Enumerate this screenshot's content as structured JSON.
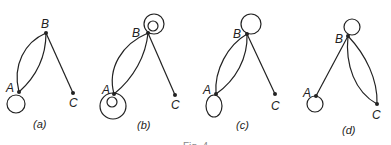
{
  "figure": {
    "caption_partial": "Fig. 4",
    "panels": [
      {
        "id": "a",
        "caption": "(a)",
        "nodes": [
          {
            "label": "A",
            "x": 19,
            "y": 92
          },
          {
            "label": "B",
            "x": 46,
            "y": 33
          },
          {
            "label": "C",
            "x": 73,
            "y": 93
          }
        ],
        "edges": [
          {
            "from": "A",
            "to": "B",
            "count": 2
          },
          {
            "from": "B",
            "to": "C",
            "count": 1
          }
        ],
        "loops": [
          {
            "node": "A",
            "count": 1
          }
        ]
      },
      {
        "id": "b",
        "caption": "(b)",
        "nodes": [
          {
            "label": "A",
            "x": 114,
            "y": 94
          },
          {
            "label": "B",
            "x": 148,
            "y": 33
          },
          {
            "label": "C",
            "x": 175,
            "y": 95
          }
        ],
        "edges": [
          {
            "from": "A",
            "to": "B",
            "count": 2
          },
          {
            "from": "B",
            "to": "C",
            "count": 1
          }
        ],
        "loops": [
          {
            "node": "A",
            "count": 2
          },
          {
            "node": "B",
            "count": 2
          }
        ]
      },
      {
        "id": "c",
        "caption": "(c)",
        "nodes": [
          {
            "label": "A",
            "x": 216,
            "y": 94
          },
          {
            "label": "B",
            "x": 247,
            "y": 34
          },
          {
            "label": "C",
            "x": 275,
            "y": 94
          }
        ],
        "edges": [
          {
            "from": "A",
            "to": "B",
            "count": 2
          },
          {
            "from": "B",
            "to": "C",
            "count": 1
          }
        ],
        "loops": [
          {
            "node": "A",
            "count": 1
          },
          {
            "node": "B",
            "count": 1
          }
        ]
      },
      {
        "id": "d",
        "caption": "(d)",
        "nodes": [
          {
            "label": "A",
            "x": 316,
            "y": 96
          },
          {
            "label": "B",
            "x": 348,
            "y": 36
          },
          {
            "label": "C",
            "x": 377,
            "y": 104
          }
        ],
        "edges": [
          {
            "from": "A",
            "to": "B",
            "count": 1
          },
          {
            "from": "B",
            "to": "C",
            "count": 2
          }
        ],
        "loops": [
          {
            "node": "A",
            "count": 1
          },
          {
            "node": "B",
            "count": 1
          }
        ]
      }
    ]
  }
}
